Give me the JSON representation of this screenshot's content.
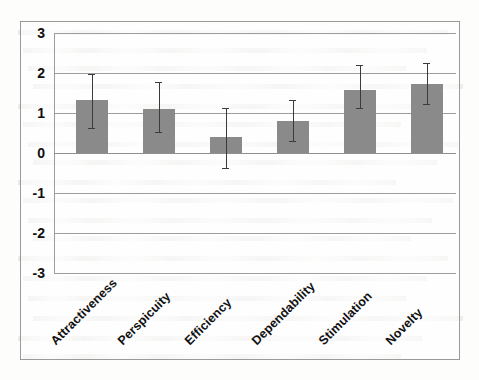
{
  "chart_data": {
    "type": "bar",
    "title": "",
    "xlabel": "",
    "ylabel": "",
    "ylim": [
      -3,
      3
    ],
    "grid": true,
    "legend": "none",
    "orientation": "vertical",
    "bar_color": "#8a8a8a",
    "error_bar_color": "#3b3b3b",
    "categories": [
      "Attractiveness",
      "Perspicuity",
      "Efficiency",
      "Dependability",
      "Stimulation",
      "Novelty"
    ],
    "values": [
      1.32,
      1.1,
      0.41,
      0.81,
      1.58,
      1.73
    ],
    "error_upper": [
      1.98,
      1.78,
      1.12,
      1.32,
      2.19,
      2.24
    ],
    "error_lower": [
      0.63,
      0.53,
      -0.38,
      0.31,
      1.12,
      1.22
    ],
    "y_ticks": [
      3,
      2,
      1,
      0,
      -1,
      -2,
      -3
    ],
    "y_tick_labels": [
      "3",
      "2",
      "1",
      "0",
      "-1",
      "-2",
      "-3"
    ]
  },
  "axes": {
    "y_axis_name": "scale-mean-axis",
    "x_axis_name": "ueq-scale-axis"
  }
}
